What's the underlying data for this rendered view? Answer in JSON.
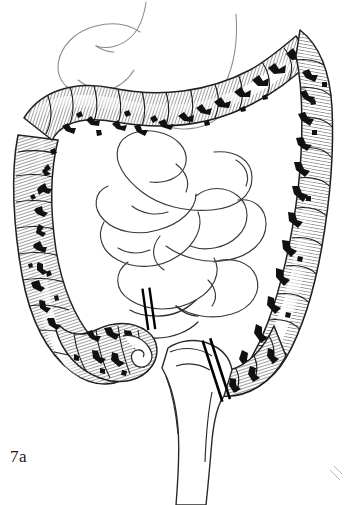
{
  "figure": {
    "caption": "7a",
    "style": "black-and-white pen-and-ink medical line drawing",
    "background_color": "#ffffff",
    "ink_color": "#1a1a1a",
    "outline_color": "#2b2b2b",
    "faint_line_color": "#8a8a8a",
    "hatch_color": "#555555",
    "lesion_color": "#111111"
  },
  "structures": [
    {
      "id": "stomach",
      "label": "Stomach",
      "diseased": false,
      "shading": "outline-only",
      "note": "faint outline upper left"
    },
    {
      "id": "cecum",
      "label": "Cecum",
      "diseased": true,
      "shading": "hatched-with-lesions"
    },
    {
      "id": "appendix",
      "label": "Appendix",
      "diseased": false,
      "shading": "outline-only"
    },
    {
      "id": "ascending-colon",
      "label": "Ascending colon",
      "diseased": true,
      "shading": "hatched-with-lesions"
    },
    {
      "id": "hepatic-flexure",
      "label": "Hepatic flexure",
      "diseased": true,
      "shading": "hatched-with-lesions"
    },
    {
      "id": "transverse-colon",
      "label": "Transverse colon",
      "diseased": true,
      "shading": "hatched-with-lesions"
    },
    {
      "id": "splenic-flexure",
      "label": "Splenic flexure",
      "diseased": true,
      "shading": "hatched-with-lesions"
    },
    {
      "id": "descending-colon",
      "label": "Descending colon",
      "diseased": true,
      "shading": "hatched-with-lesions"
    },
    {
      "id": "sigmoid-colon",
      "label": "Sigmoid colon",
      "diseased": true,
      "shading": "hatched-with-lesions"
    },
    {
      "id": "rectum",
      "label": "Rectum",
      "diseased": false,
      "shading": "outline-only"
    },
    {
      "id": "terminal-ileum",
      "label": "Terminal ileum",
      "diseased": false,
      "shading": "outline-only"
    },
    {
      "id": "small-intestine",
      "label": "Small intestine loops",
      "diseased": false,
      "shading": "outline-only"
    }
  ],
  "resection_markers": [
    {
      "id": "proximal",
      "label": "Proximal resection line at terminal ileum",
      "bars": 2,
      "x": 148,
      "y": 308,
      "angle": -8
    },
    {
      "id": "distal",
      "label": "Distal resection line at rectosigmoid junction",
      "bars": 2,
      "x": 216,
      "y": 370,
      "angle": -18
    }
  ]
}
